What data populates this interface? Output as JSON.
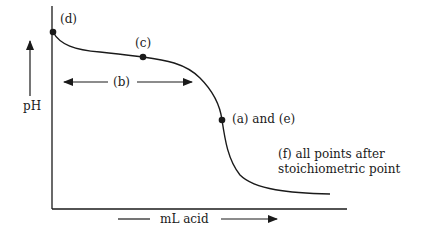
{
  "diagram": {
    "axes": {
      "y_label": "pH",
      "x_label": "mL acid"
    },
    "points": [
      {
        "id": "d",
        "label": "(d)"
      },
      {
        "id": "c",
        "label": "(c)"
      },
      {
        "id": "ae",
        "label": "(a) and (e)"
      }
    ],
    "region_b": {
      "label": "(b)"
    },
    "annotation_f": {
      "line1": "(f) all points after",
      "line2": "stoichiometric point"
    },
    "colors": {
      "ink": "#1a1a1a",
      "background": "#ffffff"
    }
  }
}
